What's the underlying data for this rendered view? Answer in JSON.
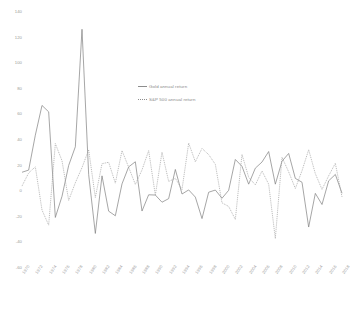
{
  "chart_data": {
    "type": "line",
    "title": "",
    "xlabel": "",
    "ylabel": "",
    "ylim": [
      -60,
      140
    ],
    "yticks": [
      140,
      120,
      100,
      80,
      60,
      40,
      20,
      0,
      -20,
      -40,
      -60
    ],
    "grid": false,
    "legend_position": "inside-top-center",
    "x": [
      1970,
      1971,
      1972,
      1973,
      1974,
      1975,
      1976,
      1977,
      1978,
      1979,
      1980,
      1981,
      1982,
      1983,
      1984,
      1985,
      1986,
      1987,
      1988,
      1989,
      1990,
      1991,
      1992,
      1993,
      1994,
      1995,
      1996,
      1997,
      1998,
      1999,
      2000,
      2001,
      2002,
      2003,
      2004,
      2005,
      2006,
      2007,
      2008,
      2009,
      2010,
      2011,
      2012,
      2013,
      2014,
      2015,
      2016,
      2017,
      2018
    ],
    "xticks": [
      1970,
      1972,
      1974,
      1976,
      1978,
      1980,
      1982,
      1984,
      1986,
      1988,
      1990,
      1992,
      1994,
      1996,
      1998,
      2000,
      2002,
      2004,
      2006,
      2008,
      2010,
      2012,
      2014,
      2016,
      2018
    ],
    "series": [
      {
        "name": "Gold annual return",
        "style": "solid",
        "color": "#7f7f7f",
        "values": [
          14.8,
          16.5,
          43.8,
          67.0,
          62.0,
          -20.5,
          -4.0,
          20.1,
          34.7,
          126.5,
          13.0,
          -33.0,
          12.0,
          -15.6,
          -19.2,
          5.7,
          19.0,
          23.0,
          -15.5,
          -2.8,
          -3.0,
          -8.6,
          -5.8,
          17.0,
          -2.2,
          1.0,
          -4.6,
          -21.4,
          -0.8,
          0.9,
          -5.5,
          0.7,
          24.8,
          19.4,
          5.5,
          18.0,
          22.8,
          31.0,
          5.5,
          23.4,
          29.5,
          10.0,
          7.0,
          -28.0,
          -1.7,
          -10.4,
          8.1,
          13.1,
          -1.6
        ]
      },
      {
        "name": "S&P 500 annual return",
        "style": "dotted",
        "color": "#9b9b9b",
        "values": [
          4.0,
          14.3,
          19.0,
          -14.7,
          -26.5,
          37.2,
          23.8,
          -7.2,
          6.6,
          18.4,
          32.4,
          -4.9,
          21.5,
          22.6,
          6.3,
          31.7,
          18.7,
          5.3,
          16.6,
          31.7,
          -3.1,
          30.5,
          7.6,
          10.1,
          1.3,
          37.6,
          23.0,
          33.4,
          28.6,
          21.0,
          -9.1,
          -11.9,
          -22.1,
          28.7,
          10.9,
          4.9,
          15.8,
          5.5,
          -37.0,
          26.5,
          15.1,
          2.1,
          16.0,
          32.4,
          13.7,
          1.4,
          12.0,
          21.8,
          -4.4
        ]
      }
    ]
  }
}
